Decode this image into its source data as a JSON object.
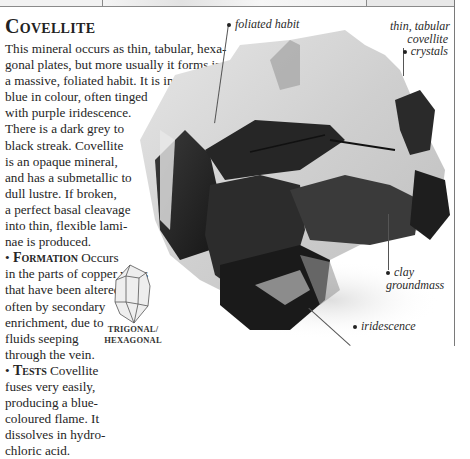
{
  "page": {
    "title": "Covellite",
    "paragraphs": [
      "This mineral occurs as thin, tabular, hexa-",
      "gonal plates, but more usually it forms in",
      "a massive, foliated habit. It is indigo-",
      "blue in colour, often tinged",
      "with purple iridescence.",
      "There is a dark grey to",
      "black streak. Covellite",
      "is an opaque mineral,",
      "and has a submetallic to",
      "dull lustre. If broken,",
      "a perfect basal cleavage",
      "into thin, flexible lami-",
      "nae is produced."
    ],
    "formation": {
      "bullet": "•",
      "heading": "Formation",
      "lines": [
        "Occurs",
        "in the parts of copper veins",
        "that have been altered –",
        "often by secondary",
        "enrichment, due to",
        "fluids seeping",
        "through the vein."
      ]
    },
    "tests": {
      "bullet": "•",
      "heading": "Tests",
      "lines": [
        "Covellite",
        "fuses very easily,",
        "producing a blue-",
        "coloured flame. It",
        "dissolves in hydro-",
        "chloric acid."
      ]
    }
  },
  "specimen": {
    "icon": "covellite-specimen-photo",
    "labels": {
      "foliated_habit": "foliated habit",
      "thin_tabular_1": "thin, tabular",
      "thin_tabular_2": "covellite",
      "thin_tabular_3": "crystals",
      "clay_1": "clay",
      "clay_2": "groundmass",
      "iridescence": "iridescence"
    }
  },
  "crystal_system": {
    "icon": "hexagonal-crystal-icon",
    "line1": "TRIGONAL/",
    "line2": "HEXAGONAL"
  }
}
